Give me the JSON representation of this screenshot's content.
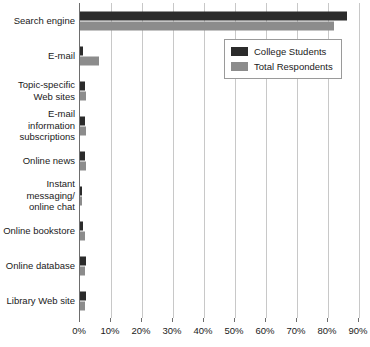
{
  "chart_data": {
    "type": "bar",
    "orientation": "horizontal",
    "title": "",
    "xlabel": "",
    "ylabel": "",
    "xlim": [
      0,
      90
    ],
    "xtick_labels": [
      "0%",
      "10%",
      "20%",
      "30%",
      "40%",
      "50%",
      "60%",
      "70%",
      "80%",
      "90%"
    ],
    "xtick_values": [
      0,
      10,
      20,
      30,
      40,
      50,
      60,
      70,
      80,
      90
    ],
    "grid": true,
    "legend_position": "top-right",
    "categories": [
      "Search engine",
      "E-mail",
      "Topic-specific Web sites",
      "E-mail information subscriptions",
      "Online news",
      "Instant messaging/ online chat",
      "Online bookstore",
      "Online database",
      "Library Web site"
    ],
    "series": [
      {
        "name": "College Students",
        "color": "#2b2b2b",
        "values": [
          86,
          1,
          1.5,
          1.5,
          1.5,
          0,
          1,
          2,
          2
        ]
      },
      {
        "name": "Total Respondents",
        "color": "#8c8c8c",
        "values": [
          82,
          6,
          2,
          2,
          2,
          0.5,
          1.5,
          1.5,
          1.5
        ]
      }
    ]
  },
  "legend": {
    "entries": [
      {
        "label": "College Students"
      },
      {
        "label": "Total Respondents"
      }
    ]
  }
}
